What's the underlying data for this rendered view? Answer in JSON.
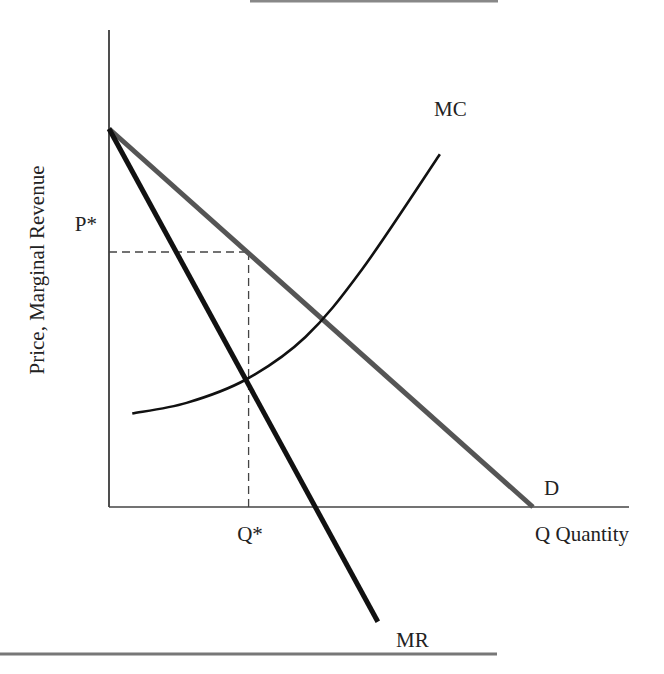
{
  "chart_data": {
    "type": "line",
    "title": "",
    "xlabel": "Quantity",
    "ylabel": "Price, Marginal Revenue",
    "x_axis_end_label": "Q Quantity",
    "xlim": [
      0,
      10
    ],
    "ylim": [
      0,
      10
    ],
    "grid": false,
    "legend": "none (curves labeled directly)",
    "series": [
      {
        "name": "D",
        "label": "D",
        "style": "gray thick line",
        "color": "#555555",
        "points": [
          [
            0,
            8.9
          ],
          [
            8.2,
            0
          ]
        ]
      },
      {
        "name": "MR",
        "label": "MR",
        "style": "black thick line",
        "color": "#111111",
        "points": [
          [
            0,
            8.9
          ],
          [
            5.2,
            -2.7
          ]
        ]
      },
      {
        "name": "MC",
        "label": "MC",
        "style": "black curve",
        "color": "#111111",
        "points": [
          [
            0.45,
            2.2
          ],
          [
            1.5,
            2.45
          ],
          [
            2.65,
            3.0
          ],
          [
            3.8,
            4.0
          ],
          [
            4.9,
            5.6
          ],
          [
            6.4,
            8.3
          ]
        ]
      }
    ],
    "annotations": [
      {
        "text": "P*",
        "type": "y-reference",
        "x": 2.7,
        "y": 6.0,
        "style": "dashed"
      },
      {
        "text": "Q*",
        "type": "x-reference",
        "x": 2.7,
        "y": 6.0,
        "style": "dashed"
      }
    ],
    "equilibrium": {
      "q_star": 2.7,
      "p_star": 6.0,
      "mc_equals_mr_at": [
        2.7,
        3.1
      ]
    }
  }
}
